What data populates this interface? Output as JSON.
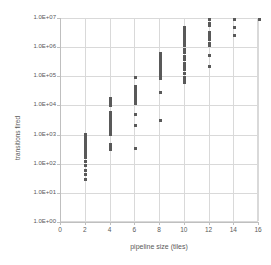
{
  "chart_data": {
    "type": "scatter",
    "title": "",
    "xlabel": "pipeline size (tiles)",
    "ylabel": "transitions fired",
    "xlim": [
      0,
      16
    ],
    "ylim": [
      1,
      10000000
    ],
    "yscale": "log",
    "grid": true,
    "legend": false,
    "marker_color": "#595959",
    "gridline_color": "#d9d9d9",
    "background_color": "#ffffff",
    "xticks": [
      0,
      2,
      4,
      6,
      8,
      10,
      12,
      14,
      16
    ],
    "xtick_labels": [
      "0",
      "2",
      "4",
      "6",
      "8",
      "10",
      "12",
      "14",
      "16"
    ],
    "yticks": [
      1,
      10,
      100,
      1000,
      10000,
      100000,
      1000000,
      10000000
    ],
    "ytick_labels": [
      "1.0E+00",
      "1.0E+01",
      "1.0E+02",
      "1.0E+03",
      "1.0E+04",
      "1.0E+05",
      "1.0E+06",
      "1.0E+07"
    ],
    "points": [
      {
        "x": 2,
        "y": 30
      },
      {
        "x": 2,
        "y": 48
      },
      {
        "x": 2,
        "y": 62
      },
      {
        "x": 2,
        "y": 95
      },
      {
        "x": 2,
        "y": 130
      },
      {
        "x": 2,
        "y": 175
      },
      {
        "x": 2,
        "y": 230
      },
      {
        "x": 2,
        "y": 290
      },
      {
        "x": 2,
        "y": 340
      },
      {
        "x": 2,
        "y": 370
      },
      {
        "x": 2,
        "y": 400
      },
      {
        "x": 2,
        "y": 440
      },
      {
        "x": 2,
        "y": 520
      },
      {
        "x": 2,
        "y": 600
      },
      {
        "x": 2,
        "y": 700
      },
      {
        "x": 2,
        "y": 780
      },
      {
        "x": 2,
        "y": 850
      },
      {
        "x": 2,
        "y": 920
      },
      {
        "x": 2,
        "y": 1000
      },
      {
        "x": 2,
        "y": 1050
      },
      {
        "x": 4,
        "y": 330
      },
      {
        "x": 4,
        "y": 380
      },
      {
        "x": 4,
        "y": 420
      },
      {
        "x": 4,
        "y": 480
      },
      {
        "x": 4,
        "y": 1100
      },
      {
        "x": 4,
        "y": 1300
      },
      {
        "x": 4,
        "y": 1500
      },
      {
        "x": 4,
        "y": 1700
      },
      {
        "x": 4,
        "y": 1900
      },
      {
        "x": 4,
        "y": 2200
      },
      {
        "x": 4,
        "y": 2600
      },
      {
        "x": 4,
        "y": 3000
      },
      {
        "x": 4,
        "y": 3600
      },
      {
        "x": 4,
        "y": 4200
      },
      {
        "x": 4,
        "y": 4800
      },
      {
        "x": 4,
        "y": 5500
      },
      {
        "x": 4,
        "y": 6200
      },
      {
        "x": 4,
        "y": 11000
      },
      {
        "x": 4,
        "y": 13000
      },
      {
        "x": 4,
        "y": 15000
      },
      {
        "x": 4,
        "y": 17000
      },
      {
        "x": 4,
        "y": 19000
      },
      {
        "x": 6,
        "y": 350
      },
      {
        "x": 6,
        "y": 2200
      },
      {
        "x": 6,
        "y": 5300
      },
      {
        "x": 6,
        "y": 13000
      },
      {
        "x": 6,
        "y": 15000
      },
      {
        "x": 6,
        "y": 18000
      },
      {
        "x": 6,
        "y": 21000
      },
      {
        "x": 6,
        "y": 24000
      },
      {
        "x": 6,
        "y": 28000
      },
      {
        "x": 6,
        "y": 31000
      },
      {
        "x": 6,
        "y": 35000
      },
      {
        "x": 6,
        "y": 39000
      },
      {
        "x": 6,
        "y": 44000
      },
      {
        "x": 6,
        "y": 50000
      },
      {
        "x": 6,
        "y": 96000
      },
      {
        "x": 8,
        "y": 3200
      },
      {
        "x": 8,
        "y": 31000
      },
      {
        "x": 8,
        "y": 90000
      },
      {
        "x": 8,
        "y": 105000
      },
      {
        "x": 8,
        "y": 120000
      },
      {
        "x": 8,
        "y": 140000
      },
      {
        "x": 8,
        "y": 160000
      },
      {
        "x": 8,
        "y": 180000
      },
      {
        "x": 8,
        "y": 200000
      },
      {
        "x": 8,
        "y": 230000
      },
      {
        "x": 8,
        "y": 260000
      },
      {
        "x": 8,
        "y": 290000
      },
      {
        "x": 8,
        "y": 330000
      },
      {
        "x": 8,
        "y": 380000
      },
      {
        "x": 8,
        "y": 430000
      },
      {
        "x": 8,
        "y": 490000
      },
      {
        "x": 8,
        "y": 560000
      },
      {
        "x": 8,
        "y": 640000
      },
      {
        "x": 10,
        "y": 68000
      },
      {
        "x": 10,
        "y": 80000
      },
      {
        "x": 10,
        "y": 95000
      },
      {
        "x": 10,
        "y": 140000
      },
      {
        "x": 10,
        "y": 180000
      },
      {
        "x": 10,
        "y": 230000
      },
      {
        "x": 10,
        "y": 300000
      },
      {
        "x": 10,
        "y": 400000
      },
      {
        "x": 10,
        "y": 520000
      },
      {
        "x": 10,
        "y": 700000
      },
      {
        "x": 10,
        "y": 900000
      },
      {
        "x": 10,
        "y": 1200000
      },
      {
        "x": 10,
        "y": 1500000
      },
      {
        "x": 10,
        "y": 1900000
      },
      {
        "x": 10,
        "y": 2400000
      },
      {
        "x": 10,
        "y": 3000000
      },
      {
        "x": 10,
        "y": 3600000
      },
      {
        "x": 10,
        "y": 4300000
      },
      {
        "x": 10,
        "y": 5100000
      },
      {
        "x": 12,
        "y": 240000
      },
      {
        "x": 12,
        "y": 560000
      },
      {
        "x": 12,
        "y": 1200000
      },
      {
        "x": 12,
        "y": 1500000
      },
      {
        "x": 12,
        "y": 2000000
      },
      {
        "x": 12,
        "y": 2400000
      },
      {
        "x": 12,
        "y": 2900000
      },
      {
        "x": 12,
        "y": 3400000
      },
      {
        "x": 12,
        "y": 5800000
      },
      {
        "x": 12,
        "y": 6800000
      },
      {
        "x": 12,
        "y": 9800000
      },
      {
        "x": 14,
        "y": 2700000
      },
      {
        "x": 14,
        "y": 5200000
      },
      {
        "x": 14,
        "y": 9800000
      },
      {
        "x": 16,
        "y": 9800000
      }
    ]
  }
}
